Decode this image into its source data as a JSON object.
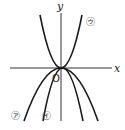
{
  "diagram": {
    "axes": {
      "x_label": "x",
      "y_label": "y",
      "origin_label": "O"
    },
    "curves": [
      {
        "id": "a",
        "label": "㋐",
        "direction": "downward",
        "relative_width": "widest"
      },
      {
        "id": "i",
        "label": "㋑",
        "direction": "downward",
        "relative_width": "medium"
      },
      {
        "id": "u",
        "label": "㋒",
        "direction": "upward",
        "relative_width": "narrow"
      }
    ]
  }
}
